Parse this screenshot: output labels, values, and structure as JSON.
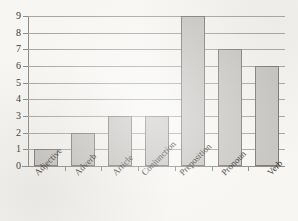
{
  "chart_data": {
    "type": "bar",
    "title": "",
    "subtitle": "",
    "xlabel": "",
    "ylabel": "",
    "categories": [
      "Adjective",
      "Adverb",
      "Article",
      "Conjunction",
      "Preposition",
      "Pronoun",
      "Verb"
    ],
    "values": [
      1,
      2,
      3,
      3,
      9,
      7,
      6
    ],
    "series": [
      {
        "name": "Count",
        "values": [
          1,
          2,
          3,
          3,
          9,
          7,
          6
        ]
      }
    ],
    "ylim": [
      0,
      9
    ],
    "ytick_labels": [
      "0",
      "1",
      "2",
      "3",
      "4",
      "5",
      "6",
      "7",
      "8",
      "9"
    ],
    "ytick_values": [
      0,
      1,
      2,
      3,
      4,
      5,
      6,
      7,
      8,
      9
    ],
    "grid": true,
    "grid_axis": "y",
    "legend": false,
    "legend_position": "none",
    "xtick_label_rotation": -45,
    "colors": {
      "bar_fill": "#c9c7c4",
      "bar_stroke": "#7f7c78",
      "gridline": "#a9a6a1",
      "axis": "#8e8b86",
      "text": "#35332f",
      "background": "#f7f6f3"
    }
  }
}
